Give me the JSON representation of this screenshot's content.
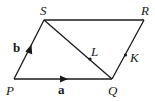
{
  "diagram": {
    "type": "parallelogram-vectors",
    "stroke_color": "#1a1a1a",
    "background": "#ffffff",
    "points": [
      {
        "id": "P",
        "label": "P",
        "x": 14,
        "y": 79
      },
      {
        "id": "Q",
        "label": "Q",
        "x": 112,
        "y": 79
      },
      {
        "id": "R",
        "label": "R",
        "x": 144,
        "y": 20
      },
      {
        "id": "S",
        "label": "S",
        "x": 44,
        "y": 20
      },
      {
        "id": "L",
        "label": "L",
        "x": 90,
        "y": 59
      },
      {
        "id": "K",
        "label": "K",
        "x": 125,
        "y": 55
      }
    ],
    "segments": [
      {
        "from": "P",
        "to": "Q"
      },
      {
        "from": "Q",
        "to": "R"
      },
      {
        "from": "R",
        "to": "S"
      },
      {
        "from": "S",
        "to": "P"
      },
      {
        "from": "S",
        "to": "Q"
      }
    ],
    "vectors": [
      {
        "name": "a",
        "label": "a",
        "along": "PQ"
      },
      {
        "name": "b",
        "label": "b",
        "along": "PS"
      }
    ],
    "labels": {
      "P": "P",
      "Q": "Q",
      "R": "R",
      "S": "S",
      "L": "L",
      "K": "K",
      "a": "a",
      "b": "b"
    }
  }
}
